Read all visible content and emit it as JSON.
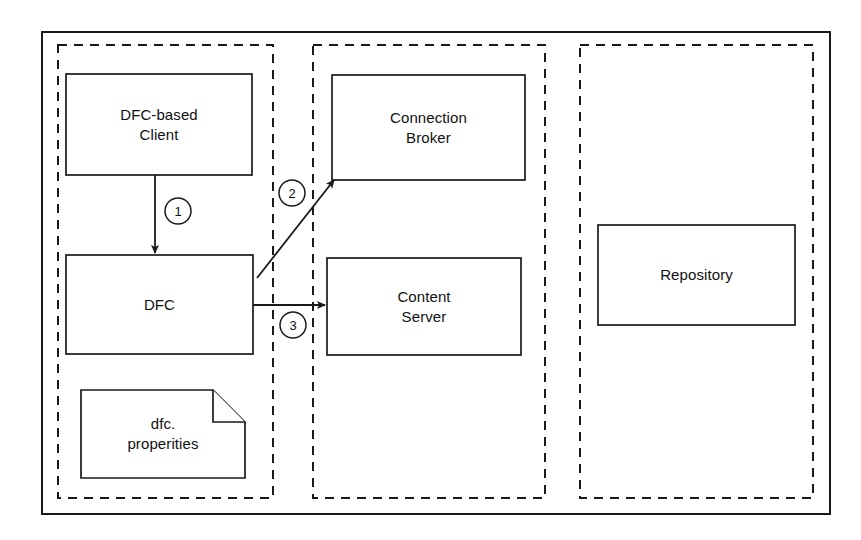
{
  "diagram": {
    "background_color": "#ffffff",
    "stroke_color": "#1a1a1a",
    "fill_color": "#ffffff",
    "outer_frame": {
      "name": "outer-frame",
      "x": 42,
      "y": 32,
      "width": 788,
      "height": 482
    },
    "zones": [
      {
        "id": "client-zone",
        "x": 58,
        "y": 45,
        "width": 215,
        "height": 453
      },
      {
        "id": "server-zone",
        "x": 313,
        "y": 45,
        "width": 232,
        "height": 453
      },
      {
        "id": "repository-zone",
        "x": 580,
        "y": 45,
        "width": 233,
        "height": 453
      }
    ],
    "nodes": [
      {
        "id": "dfc-based-client",
        "label": "DFC-based\nClient",
        "shape": "rectangle",
        "x": 66,
        "y": 74,
        "width": 186,
        "height": 101
      },
      {
        "id": "dfc",
        "label": "DFC",
        "shape": "rectangle",
        "x": 66,
        "y": 255,
        "width": 187,
        "height": 99
      },
      {
        "id": "dfc-properties",
        "label": "dfc.\nproperities",
        "shape": "document",
        "x": 81,
        "y": 390,
        "width": 164,
        "height": 88,
        "fold": 32
      },
      {
        "id": "connection-broker",
        "label": "Connection\nBroker",
        "shape": "rectangle",
        "x": 332,
        "y": 75,
        "width": 193,
        "height": 105
      },
      {
        "id": "content-server",
        "label": "Content\nServer",
        "shape": "rectangle",
        "x": 327,
        "y": 258,
        "width": 194,
        "height": 97
      },
      {
        "id": "repository",
        "label": "Repository",
        "shape": "rectangle",
        "x": 598,
        "y": 225,
        "width": 197,
        "height": 100
      }
    ],
    "connectors": [
      {
        "id": "client-to-dfc",
        "from": "dfc-based-client",
        "to": "dfc",
        "step": "1",
        "x1": 155,
        "y1": 175,
        "x2": 155,
        "y2": 253,
        "label_cx": 178,
        "label_cy": 211,
        "label_r": 13
      },
      {
        "id": "dfc-to-connection-broker",
        "from": "dfc",
        "to": "connection-broker",
        "step": "2",
        "x1": 257,
        "y1": 278,
        "x2": 334,
        "y2": 180,
        "label_cx": 292,
        "label_cy": 193,
        "label_r": 13
      },
      {
        "id": "dfc-to-content-server",
        "from": "dfc",
        "to": "content-server",
        "step": "3",
        "x1": 253,
        "y1": 305,
        "x2": 325,
        "y2": 305,
        "label_cx": 293,
        "label_cy": 325,
        "label_r": 13
      }
    ]
  }
}
